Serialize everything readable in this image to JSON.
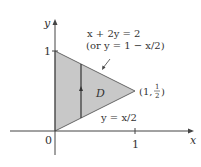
{
  "diagram": {
    "region_label": "D",
    "axes": {
      "x_label": "x",
      "y_label": "y",
      "origin_label": "0",
      "x_tick_label": "1",
      "y_tick_label": "1"
    },
    "upper_boundary": {
      "equation": "x + 2y = 2",
      "alt_equation": "(or y = 1 − x/2)"
    },
    "lower_boundary": {
      "equation": "y = x/2"
    },
    "vertex_point": {
      "open": "(1,",
      "num": "1",
      "den": "2",
      "close": ")"
    },
    "colors": {
      "region_fill": "#c8c8c8",
      "region_stroke": "#555555",
      "axis": "#444444",
      "text": "#333333"
    }
  }
}
